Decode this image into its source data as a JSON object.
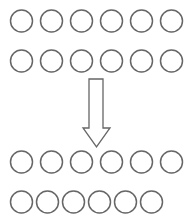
{
  "diagram": {
    "stroke_color": "#666666",
    "background": "#ffffff",
    "circle_radius": 11,
    "rows": [
      {
        "name": "top-row-1",
        "cy": 21,
        "cx": [
          21.5,
          51.5,
          81.5,
          111.5,
          141.5,
          171.5
        ]
      },
      {
        "name": "top-row-2",
        "cy": 61,
        "cx": [
          21.5,
          51.5,
          81.5,
          111.5,
          141.5,
          171.5
        ]
      },
      {
        "name": "bottom-row-1",
        "cy": 162,
        "cx": [
          21.5,
          51.5,
          81.5,
          111.5,
          141.5,
          171.5
        ]
      },
      {
        "name": "bottom-row-2",
        "cy": 202,
        "cx": [
          21.5,
          47.5,
          73.5,
          99.5,
          125.5,
          151.5
        ]
      }
    ],
    "arrow": {
      "direction": "down",
      "shaft_x": [
        89,
        103
      ],
      "shaft_y": [
        79,
        128
      ],
      "head_x": [
        83,
        110
      ],
      "tip_y": 147
    }
  }
}
